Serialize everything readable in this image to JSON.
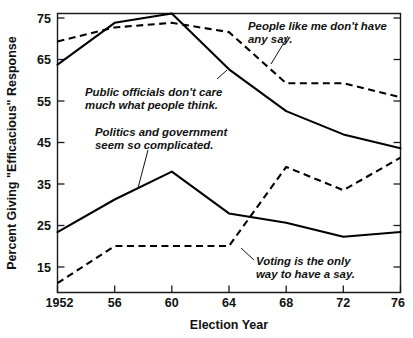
{
  "chart_data": {
    "type": "line",
    "title": "",
    "xlabel": "Election Year",
    "ylabel": "Percent Giving \"Efficacious\" Response",
    "x": [
      1952,
      1956,
      1960,
      1964,
      1968,
      1972,
      1976
    ],
    "xtick_labels": [
      "1952",
      "56",
      "60",
      "64",
      "68",
      "72",
      "76"
    ],
    "ytick_labels": [
      "15",
      "25",
      "35",
      "45",
      "55",
      "65",
      "75"
    ],
    "ytick_values": [
      15,
      25,
      35,
      45,
      55,
      65,
      75
    ],
    "xlim": [
      1952,
      1976
    ],
    "ylim": [
      15,
      75
    ],
    "grid": false,
    "legend_position": "annotations-inline",
    "series": [
      {
        "name": "People like me don't have any say.",
        "style": "dashed",
        "values": [
          69,
          72,
          73,
          71,
          60,
          60,
          57
        ]
      },
      {
        "name": "Public officials don't care much what people think.",
        "style": "solid",
        "values": [
          64,
          73,
          75,
          63,
          54,
          49,
          46
        ]
      },
      {
        "name": "Politics and government seem so complicated.",
        "style": "solid",
        "values": [
          28,
          35,
          41,
          32,
          30,
          27,
          28
        ]
      },
      {
        "name": "Voting is the only way to have a say.",
        "style": "dashed",
        "values": [
          17,
          25,
          25,
          25,
          42,
          37,
          44
        ]
      }
    ],
    "annotations": [
      {
        "id": "people-like-me",
        "line1": "People like me don't have",
        "line2": "any say."
      },
      {
        "id": "public-officials",
        "line1": "Public officials don't care",
        "line2": "much what people think."
      },
      {
        "id": "politics-complicated",
        "line1": "Politics and government",
        "line2": "seem so complicated."
      },
      {
        "id": "voting-only-way",
        "line1": "Voting is the only",
        "line2": "way to have a say."
      }
    ]
  }
}
